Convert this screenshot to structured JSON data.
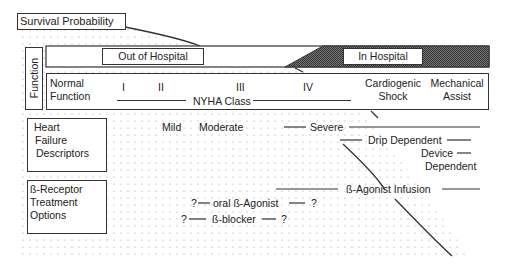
{
  "title_box": {
    "label": "Survival Probability"
  },
  "function_label": "Function",
  "care_setting": {
    "out_of_hospital": "Out of Hospital",
    "in_hospital": "In Hospital"
  },
  "function_row": {
    "normal_function_line1": "Normal",
    "normal_function_line2": "Function",
    "nyha_classes": [
      "I",
      "II",
      "III",
      "IV"
    ],
    "nyha_label": "NYHA Class",
    "cardiogenic_line1": "Cardiogenic",
    "cardiogenic_line2": "Shock",
    "mechanical_line1": "Mechanical",
    "mechanical_line2": "Assist"
  },
  "descriptors": {
    "box_line1": "Heart",
    "box_line2": "Failure",
    "box_line3": "Descriptors",
    "mild": "Mild",
    "moderate": "Moderate",
    "severe": "Severe",
    "drip_dependent": "Drip Dependent",
    "device_line1": "Device",
    "device_line2": "Dependent"
  },
  "treatment": {
    "box_line1": "ß-Receptor",
    "box_line2": "Treatment",
    "box_line3": "Options",
    "agonist_infusion": "ß-Agonist  Infusion",
    "oral_agonist": "oral  ß-Agonist",
    "blocker": "ß-blocker",
    "q": "?"
  },
  "colors": {
    "line": "#333333",
    "dot": "#9a9a9a",
    "shade": "#555555"
  }
}
